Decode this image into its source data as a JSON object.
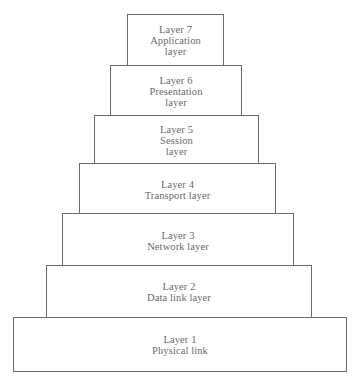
{
  "diagram": {
    "type": "stacked-pyramid",
    "layers": [
      {
        "number": "Layer 7",
        "name_lines": [
          "Application",
          "layer"
        ]
      },
      {
        "number": "Layer 6",
        "name_lines": [
          "Presentation",
          "layer"
        ]
      },
      {
        "number": "Layer 5",
        "name_lines": [
          "Session",
          "layer"
        ]
      },
      {
        "number": "Layer 4",
        "name_lines": [
          "Transport layer"
        ]
      },
      {
        "number": "Layer 3",
        "name_lines": [
          "Network layer"
        ]
      },
      {
        "number": "Layer 2",
        "name_lines": [
          "Data link layer"
        ]
      },
      {
        "number": "Layer 1",
        "name_lines": [
          "Physical link"
        ]
      }
    ],
    "colors": {
      "border": "#6b6b6b",
      "text": "#6a6a6a",
      "background": "#ffffff"
    }
  }
}
